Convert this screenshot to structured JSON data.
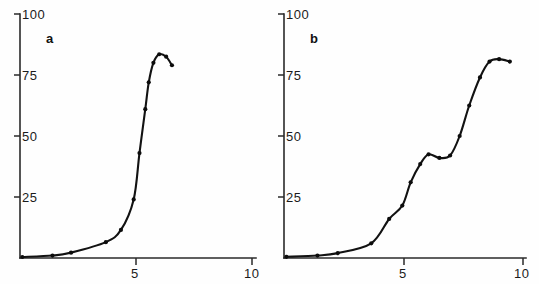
{
  "figure": {
    "background_color": "#fefefe",
    "ink_color": "#121212"
  },
  "chart_data": [
    {
      "type": "line",
      "title": "",
      "panel_label": "a",
      "xlabel": "",
      "ylabel": "",
      "xlim": [
        0,
        10.3
      ],
      "ylim": [
        0,
        100
      ],
      "xticks": [
        5,
        10
      ],
      "xtick_labels": [
        "5",
        "10"
      ],
      "yticks": [
        25,
        50,
        75,
        100
      ],
      "ytick_labels": [
        "25",
        "50",
        "75",
        "100"
      ],
      "grid": false,
      "legend": "none",
      "markers": "filled-circle",
      "series": [
        {
          "name": "curve-a",
          "x": [
            0.1,
            1.4,
            2.2,
            3.7,
            4.35,
            4.9,
            5.15,
            5.4,
            5.55,
            5.75,
            6.0,
            6.3,
            6.55
          ],
          "values": [
            0.4,
            1.0,
            2.2,
            6.5,
            11.5,
            24.0,
            43.0,
            61.0,
            72.0,
            80.0,
            83.5,
            82.5,
            79.0
          ]
        }
      ]
    },
    {
      "type": "line",
      "title": "",
      "panel_label": "b",
      "xlabel": "",
      "ylabel": "",
      "xlim": [
        0,
        10.3
      ],
      "ylim": [
        0,
        100
      ],
      "xticks": [
        5,
        10
      ],
      "xtick_labels": [
        "5",
        "10"
      ],
      "yticks": [
        25,
        50,
        75,
        100
      ],
      "ytick_labels": [
        "25",
        "50",
        "75",
        "100"
      ],
      "grid": false,
      "legend": "none",
      "markers": "filled-circle",
      "series": [
        {
          "name": "curve-b",
          "x": [
            0.1,
            1.4,
            2.25,
            3.65,
            4.4,
            4.95,
            5.3,
            5.7,
            6.05,
            6.5,
            6.95,
            7.35,
            7.75,
            8.2,
            8.6,
            9.0,
            9.45
          ],
          "values": [
            0.5,
            1.0,
            2.0,
            6.0,
            16.0,
            21.5,
            31.0,
            38.5,
            42.5,
            41.0,
            42.0,
            50.0,
            62.5,
            74.0,
            80.5,
            81.5,
            80.5
          ]
        }
      ]
    }
  ]
}
